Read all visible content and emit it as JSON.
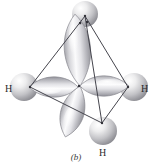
{
  "figure": {
    "caption": "(b)",
    "background_color": "#ffffff",
    "edge_color": "#4a4a52",
    "lobe_outline_color": "#8f8f95",
    "sphere_color": "#c9c9cc",
    "label_color": "#2b2b2b"
  },
  "atoms": [
    {
      "id": "h-left",
      "label": "H",
      "x": 30,
      "y": 87
    },
    {
      "id": "h-right",
      "label": "H",
      "x": 128,
      "y": 87
    },
    {
      "id": "h-top",
      "label": "",
      "x": 85,
      "y": 16
    },
    {
      "id": "h-bottom",
      "label": "H",
      "x": 102,
      "y": 123
    }
  ],
  "center": {
    "x": 79,
    "y": 86
  },
  "orbitals": [
    {
      "id": "lobe-up",
      "points_to": "h-top",
      "style": "sp3-lobe"
    },
    {
      "id": "lobe-left",
      "points_to": "h-left",
      "style": "sp3-lobe"
    },
    {
      "id": "lobe-right",
      "points_to": "h-right",
      "style": "sp3-lobe"
    },
    {
      "id": "lobe-down-front",
      "points_to": "h-bottom",
      "style": "sp3-lobe"
    }
  ],
  "edges": [
    {
      "from": "h-top",
      "to": "h-left",
      "style": "solid"
    },
    {
      "from": "h-top",
      "to": "h-right",
      "style": "solid"
    },
    {
      "from": "h-top",
      "to": "h-bottom",
      "style": "solid"
    },
    {
      "from": "h-left",
      "to": "h-bottom",
      "style": "solid"
    },
    {
      "from": "h-right",
      "to": "h-bottom",
      "style": "solid"
    },
    {
      "from": "h-left",
      "to": "h-right",
      "style": "dashed"
    }
  ]
}
